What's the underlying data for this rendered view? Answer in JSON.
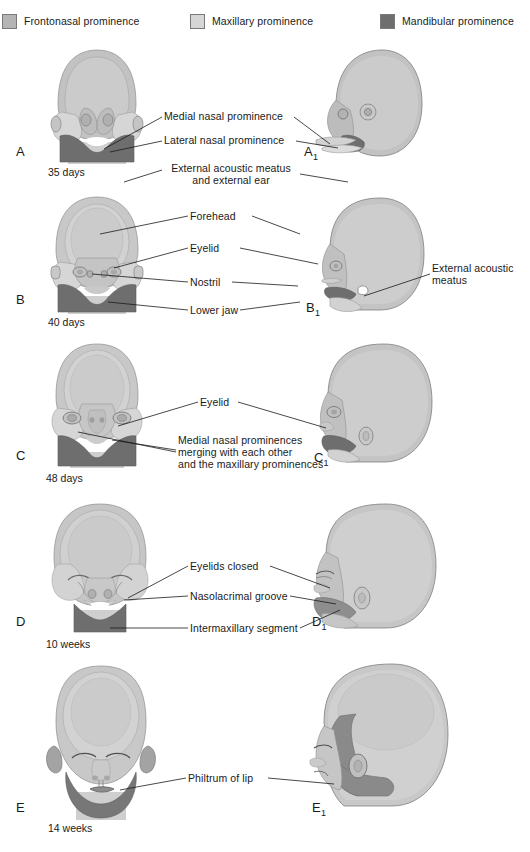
{
  "legend": {
    "items": [
      {
        "label": "Frontonasal prominence",
        "color": "#b4b4b4",
        "icon": "color-swatch"
      },
      {
        "label": "Maxillary prominence",
        "color": "#d6d6d6",
        "icon": "color-swatch"
      },
      {
        "label": "Mandibular prominence",
        "color": "#6e6e6e",
        "icon": "color-swatch"
      }
    ]
  },
  "palette": {
    "frontonasal": "#b4b4b4",
    "maxillary": "#d6d6d6",
    "mandibular": "#6e6e6e",
    "skin_light": "#cfcfcf",
    "skin_mid": "#c2c2c2",
    "skin_dark": "#a9a9a9",
    "outline": "#555555",
    "text": "#1a1a1a"
  },
  "panels": [
    {
      "id": "A",
      "stage_letter": "A",
      "stage_letter_sub": "",
      "stage_letter_profile": "A",
      "stage_letter_profile_sub": "1",
      "caption": "35 days",
      "labels": [
        {
          "text": "Medial nasal prominence"
        },
        {
          "text": "Lateral nasal prominence"
        },
        {
          "text": "External acoustic meatus",
          "text2": "and external ear"
        }
      ]
    },
    {
      "id": "B",
      "stage_letter": "B",
      "stage_letter_sub": "",
      "stage_letter_profile": "B",
      "stage_letter_profile_sub": "1",
      "caption": "40 days",
      "labels": [
        {
          "text": "Forehead"
        },
        {
          "text": "Eyelid"
        },
        {
          "text": "Nostril"
        },
        {
          "text": "Lower jaw"
        },
        {
          "text": "External acoustic",
          "text2": "meatus"
        }
      ]
    },
    {
      "id": "C",
      "stage_letter": "C",
      "stage_letter_sub": "",
      "stage_letter_profile": "C",
      "stage_letter_profile_sub": "1",
      "caption": "48 days",
      "labels": [
        {
          "text": "Eyelid"
        },
        {
          "text": "Medial nasal prominences",
          "text2": "merging with each other",
          "text3": "and the maxillary prominences"
        }
      ]
    },
    {
      "id": "D",
      "stage_letter": "D",
      "stage_letter_sub": "",
      "stage_letter_profile": "D",
      "stage_letter_profile_sub": "1",
      "caption": "10 weeks",
      "labels": [
        {
          "text": "Eyelids closed"
        },
        {
          "text": "Nasolacrimal groove"
        },
        {
          "text": "Intermaxillary segment"
        }
      ]
    },
    {
      "id": "E",
      "stage_letter": "E",
      "stage_letter_sub": "",
      "stage_letter_profile": "E",
      "stage_letter_profile_sub": "1",
      "caption": "14 weeks",
      "labels": [
        {
          "text": "Philtrum of lip"
        }
      ]
    }
  ]
}
